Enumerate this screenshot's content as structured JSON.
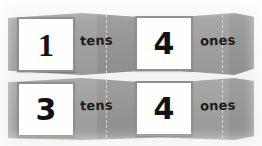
{
  "scene": {
    "title": "Place value foldable strips showing tens and ones",
    "background_color": "#f6f6f5",
    "strip_color": "#9e9e9c",
    "card_color": "#fefefe",
    "card_border_color": "#8e8e8c",
    "digit_color": "#121212",
    "label_color": "#1c1c1c",
    "crease_color": "#ebebeb"
  },
  "rows": [
    {
      "name": "top-row",
      "number": "14",
      "tens": {
        "digit": "1",
        "label": "tens"
      },
      "ones": {
        "digit": "4",
        "label": "ones"
      }
    },
    {
      "name": "bottom-row",
      "number": "34",
      "tens": {
        "digit": "3",
        "label": "tens"
      },
      "ones": {
        "digit": "4",
        "label": "ones"
      }
    }
  ]
}
